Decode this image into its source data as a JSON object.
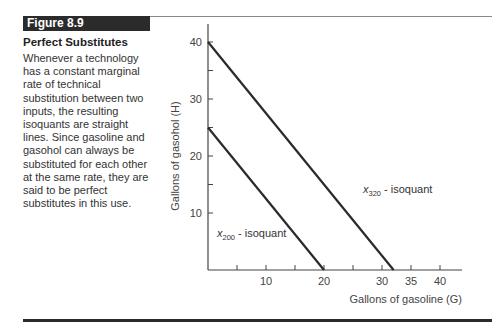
{
  "figure": {
    "label": "Figure 8.9",
    "title": "Perfect Substitutes",
    "caption": "Whenever a technology has a constant marginal rate of technical substitution between two inputs, the resulting isoquants are straight lines. Since gasoline and gasohol can always be substituted for each other at the same rate, they are said to be perfect substitutes in this use."
  },
  "chart_data": {
    "type": "line",
    "title": "Perfect Substitutes",
    "xlabel": "Gallons of gasoline (G)",
    "ylabel": "Gallons of gasohol (H)",
    "xlim": [
      0,
      42
    ],
    "ylim": [
      0,
      40
    ],
    "x_ticks": [
      5,
      10,
      15,
      20,
      25,
      30,
      35,
      40
    ],
    "x_tick_labels": [
      "",
      "10",
      "",
      "20",
      "",
      "30",
      "35",
      "40"
    ],
    "y_ticks": [
      10,
      15,
      20,
      25,
      30,
      35,
      40
    ],
    "y_tick_labels": [
      "10",
      "",
      "20",
      "",
      "30",
      "",
      "40"
    ],
    "grid": false,
    "series": [
      {
        "name": "x200 - isoquant",
        "label_main": "x",
        "label_sub": "200",
        "label_rest": " - isoquant",
        "x": [
          0,
          20
        ],
        "y": [
          25,
          0
        ]
      },
      {
        "name": "x320 - isoquant",
        "label_main": "x",
        "label_sub": "320",
        "label_rest": " - isoquant",
        "x": [
          0,
          32
        ],
        "y": [
          40,
          0
        ]
      }
    ]
  }
}
